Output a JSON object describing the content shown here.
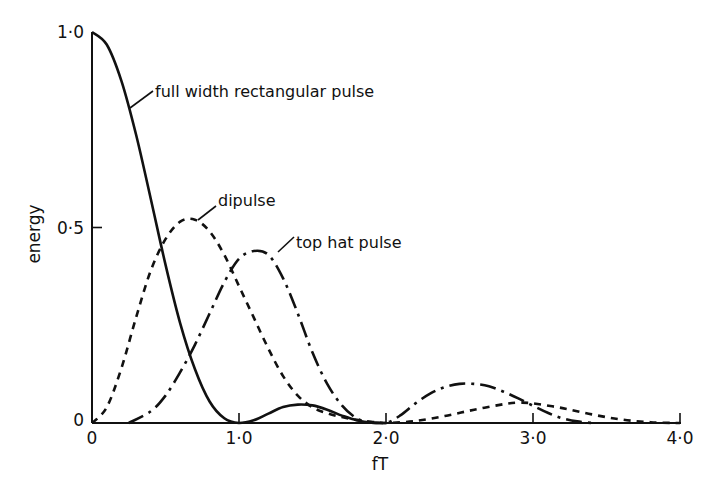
{
  "chart_data": {
    "type": "line",
    "title": "",
    "xlabel": "fT",
    "ylabel": "energy",
    "xlim": [
      0,
      4.0
    ],
    "ylim": [
      0,
      1.0
    ],
    "grid": false,
    "legend": "inline annotations with leader lines",
    "x_ticks": [
      {
        "value": 0,
        "label": "0"
      },
      {
        "value": 1.0,
        "label": "1·0"
      },
      {
        "value": 2.0,
        "label": "2·0"
      },
      {
        "value": 3.0,
        "label": "3·0"
      },
      {
        "value": 4.0,
        "label": "4·0"
      }
    ],
    "y_ticks": [
      {
        "value": 0,
        "label": "0"
      },
      {
        "value": 0.5,
        "label": "0·5"
      },
      {
        "value": 1.0,
        "label": "1·0"
      }
    ],
    "series": [
      {
        "name": "full width rectangular pulse",
        "style": "solid",
        "x": [
          0,
          0.1,
          0.2,
          0.3,
          0.4,
          0.5,
          0.6,
          0.7,
          0.8,
          0.9,
          1.0,
          1.1,
          1.2,
          1.3,
          1.4,
          1.5,
          1.6,
          1.7,
          1.8,
          1.9,
          2.0
        ],
        "values": [
          1.0,
          0.968,
          0.875,
          0.737,
          0.573,
          0.405,
          0.255,
          0.138,
          0.055,
          0.012,
          0.0,
          0.007,
          0.024,
          0.041,
          0.047,
          0.045,
          0.034,
          0.019,
          0.007,
          0.001,
          0.0
        ]
      },
      {
        "name": "dipulse",
        "style": "dashed",
        "x": [
          0,
          0.1,
          0.2,
          0.3,
          0.4,
          0.5,
          0.6,
          0.7,
          0.8,
          0.9,
          1.0,
          1.1,
          1.2,
          1.3,
          1.4,
          1.5,
          1.6,
          1.7,
          1.8,
          1.9,
          2.0,
          2.2,
          2.4,
          2.6,
          2.8,
          2.9,
          3.0,
          3.2,
          3.4,
          3.6,
          3.8,
          4.0
        ],
        "values": [
          0.0,
          0.04,
          0.14,
          0.27,
          0.39,
          0.47,
          0.515,
          0.52,
          0.49,
          0.43,
          0.35,
          0.27,
          0.19,
          0.12,
          0.07,
          0.04,
          0.025,
          0.015,
          0.008,
          0.003,
          0.0,
          0.005,
          0.018,
          0.034,
          0.048,
          0.052,
          0.05,
          0.038,
          0.022,
          0.009,
          0.002,
          0.0
        ]
      },
      {
        "name": "top hat pulse",
        "style": "dash-dot",
        "x": [
          0.25,
          0.4,
          0.5,
          0.6,
          0.7,
          0.8,
          0.9,
          1.0,
          1.1,
          1.2,
          1.3,
          1.4,
          1.5,
          1.6,
          1.7,
          1.8,
          1.9,
          2.0,
          2.1,
          2.2,
          2.3,
          2.4,
          2.5,
          2.6,
          2.7,
          2.8,
          2.9,
          3.0,
          3.1,
          3.2,
          3.3,
          3.4
        ],
        "values": [
          0.0,
          0.03,
          0.07,
          0.13,
          0.2,
          0.28,
          0.36,
          0.42,
          0.44,
          0.43,
          0.37,
          0.28,
          0.18,
          0.1,
          0.045,
          0.012,
          0.001,
          0.0,
          0.02,
          0.05,
          0.075,
          0.092,
          0.1,
          0.1,
          0.094,
          0.08,
          0.063,
          0.044,
          0.026,
          0.012,
          0.004,
          0.0
        ]
      }
    ],
    "annotations": [
      {
        "text": "full width rectangular pulse",
        "target_x": 0.28,
        "target_y": 0.76
      },
      {
        "text": "dipulse",
        "target_x": 0.72,
        "target_y": 0.52
      },
      {
        "text": "top hat pulse",
        "target_x": 1.3,
        "target_y": 0.43
      }
    ]
  }
}
